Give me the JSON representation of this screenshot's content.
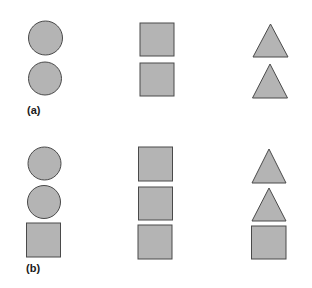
{
  "figure": {
    "style": {
      "fill": "#b4b4b4",
      "stroke": "#4a4a4a",
      "background": "#ffffff"
    },
    "panels": [
      {
        "label": "(a)",
        "columns": [
          {
            "name": "circles",
            "shapes": [
              "circle",
              "circle"
            ]
          },
          {
            "name": "squares",
            "shapes": [
              "square",
              "square"
            ]
          },
          {
            "name": "triangles",
            "shapes": [
              "triangle",
              "triangle"
            ]
          }
        ]
      },
      {
        "label": "(b)",
        "columns": [
          {
            "name": "circles-plus-square",
            "shapes": [
              "circle",
              "circle",
              "square"
            ]
          },
          {
            "name": "squares",
            "shapes": [
              "square",
              "square",
              "square"
            ]
          },
          {
            "name": "triangles-plus-square",
            "shapes": [
              "triangle",
              "triangle",
              "square"
            ]
          }
        ]
      }
    ]
  }
}
